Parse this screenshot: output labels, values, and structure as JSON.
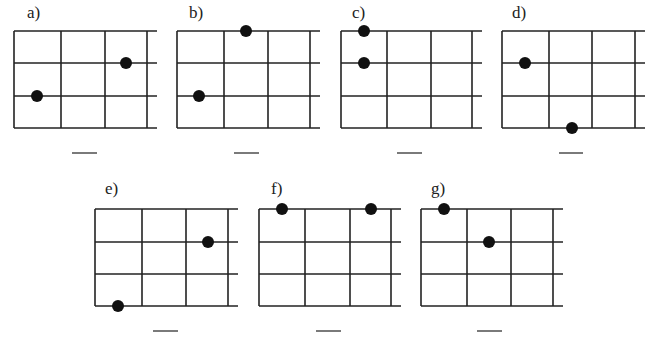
{
  "colors": {
    "line": "#222222",
    "dot": "#111111",
    "background": "#ffffff"
  },
  "grid": {
    "columns": 3,
    "rows": 3,
    "open_right_edge": true
  },
  "panels": [
    {
      "label": "a)",
      "left": 14,
      "top": 31,
      "col_x": [
        14,
        61,
        105,
        147
      ],
      "right_end": 157,
      "row_y": [
        31,
        63,
        96,
        128
      ],
      "dots": [
        {
          "x": 37,
          "y": 96
        },
        {
          "x": 126,
          "y": 63
        }
      ],
      "answer_blank": {
        "x1": 72,
        "x2": 97,
        "y": 153,
        "value": ""
      }
    },
    {
      "label": "b)",
      "left": 177,
      "top": 31,
      "col_x": [
        177,
        224,
        268,
        310
      ],
      "right_end": 320,
      "row_y": [
        31,
        63,
        96,
        128
      ],
      "dots": [
        {
          "x": 246,
          "y": 31
        },
        {
          "x": 199,
          "y": 96
        }
      ],
      "answer_blank": {
        "x1": 234,
        "x2": 259,
        "y": 153,
        "value": ""
      }
    },
    {
      "label": "c)",
      "left": 341,
      "top": 31,
      "col_x": [
        341,
        387,
        431,
        472
      ],
      "right_end": 482,
      "row_y": [
        31,
        63,
        96,
        128
      ],
      "dots": [
        {
          "x": 364,
          "y": 31
        },
        {
          "x": 364,
          "y": 63
        }
      ],
      "answer_blank": {
        "x1": 397,
        "x2": 422,
        "y": 153,
        "value": ""
      }
    },
    {
      "label": "d)",
      "left": 502,
      "top": 31,
      "col_x": [
        502,
        549,
        592,
        635
      ],
      "right_end": 645,
      "row_y": [
        31,
        63,
        96,
        128
      ],
      "dots": [
        {
          "x": 525,
          "y": 63
        },
        {
          "x": 572,
          "y": 128
        }
      ],
      "answer_blank": {
        "x1": 559,
        "x2": 583,
        "y": 153,
        "value": ""
      }
    },
    {
      "label": "e)",
      "left": 95,
      "top": 209,
      "col_x": [
        95,
        142,
        186,
        228
      ],
      "right_end": 238,
      "row_y": [
        209,
        242,
        274,
        306
      ],
      "dots": [
        {
          "x": 208,
          "y": 242
        },
        {
          "x": 118,
          "y": 306
        }
      ],
      "answer_blank": {
        "x1": 153,
        "x2": 178,
        "y": 331,
        "value": ""
      }
    },
    {
      "label": "f)",
      "left": 259,
      "top": 209,
      "col_x": [
        259,
        305,
        350,
        391
      ],
      "right_end": 401,
      "row_y": [
        209,
        242,
        274,
        306
      ],
      "dots": [
        {
          "x": 282,
          "y": 209
        },
        {
          "x": 371,
          "y": 209
        }
      ],
      "answer_blank": {
        "x1": 316,
        "x2": 341,
        "y": 331,
        "value": ""
      }
    },
    {
      "label": "g)",
      "left": 421,
      "top": 209,
      "col_x": [
        421,
        467,
        511,
        553
      ],
      "right_end": 563,
      "row_y": [
        209,
        242,
        274,
        306
      ],
      "dots": [
        {
          "x": 444,
          "y": 209
        },
        {
          "x": 489,
          "y": 242
        }
      ],
      "answer_blank": {
        "x1": 477,
        "x2": 502,
        "y": 331,
        "value": ""
      }
    }
  ]
}
